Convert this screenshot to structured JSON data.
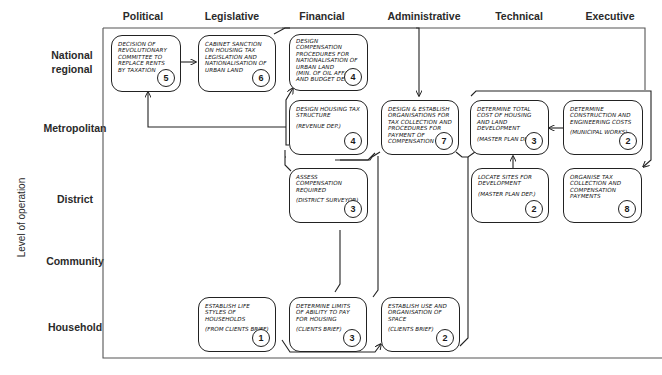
{
  "diagram": {
    "axis_label": "Level of operation",
    "columns": [
      "Political",
      "Legislative",
      "Financial",
      "Administrative",
      "Technical",
      "Executive"
    ],
    "rows": [
      "National regional",
      "Metropolitan",
      "District",
      "Community",
      "Household"
    ],
    "boxes": [
      {
        "id": "b1",
        "column": "Political",
        "row": "National regional",
        "text": "Decision of revolutionary committee to replace rents by taxation",
        "note": "",
        "number": "5"
      },
      {
        "id": "b2",
        "column": "Legislative",
        "row": "National regional",
        "text": "Cabinet sanction on housing tax legislation and nationalisation of urban land",
        "note": "",
        "number": "6"
      },
      {
        "id": "b3",
        "column": "Financial",
        "row": "National regional",
        "text": "Design compensation procedures for nationalisation of urban land",
        "note": "(Min. of Oil Affairs and Budget Dep.)",
        "number": "4"
      },
      {
        "id": "b4",
        "column": "Financial",
        "row": "Metropolitan",
        "text": "Design housing tax structure",
        "note": "(Revenue Dep.)",
        "number": "4"
      },
      {
        "id": "b5",
        "column": "Administrative",
        "row": "Metropolitan",
        "text": "Design & establish organisations for tax collection and procedures for payment of compensation",
        "note": "",
        "number": "7"
      },
      {
        "id": "b6",
        "column": "Technical",
        "row": "Metropolitan",
        "text": "Determine total cost of housing and land development",
        "note": "(Master Plan Dep.)",
        "number": "3"
      },
      {
        "id": "b7",
        "column": "Executive",
        "row": "Metropolitan",
        "text": "Determine construction and engineering costs",
        "note": "(Municipal Works)",
        "number": "2"
      },
      {
        "id": "b8",
        "column": "Financial",
        "row": "District",
        "text": "Assess compensation required",
        "note": "(District Surveyor)",
        "number": "3"
      },
      {
        "id": "b9",
        "column": "Technical",
        "row": "District",
        "text": "Locate sites for development",
        "note": "(Master Plan Dep.)",
        "number": "2"
      },
      {
        "id": "b10",
        "column": "Executive",
        "row": "District",
        "text": "Organise tax collection and compensation payments",
        "note": "",
        "number": "8"
      },
      {
        "id": "b11",
        "column": "Legislative",
        "row": "Household",
        "text": "Establish life styles of households",
        "note": "(From clients brief)",
        "number": "1"
      },
      {
        "id": "b12",
        "column": "Financial",
        "row": "Household",
        "text": "Determine limits of ability to pay for housing",
        "note": "(Clients brief)",
        "number": "3"
      },
      {
        "id": "b13",
        "column": "Administrative",
        "row": "Household",
        "text": "Establish use and organisation of space",
        "note": "(Clients brief)",
        "number": "2"
      }
    ],
    "connectors": [
      {
        "from": "Decision of revolutionary committee (5)",
        "to": "Cabinet sanction (6)"
      },
      {
        "from": "Cabinet sanction (6)",
        "to": "Design & establish organisations (7)"
      },
      {
        "from": "Design housing tax structure (4)",
        "to": "Decision of revolutionary committee (5)"
      },
      {
        "from": "Design housing tax structure (4)",
        "to": "Design compensation procedures (4)"
      },
      {
        "from": "Design & establish organisations (7)",
        "to": "Design housing tax structure (4)"
      },
      {
        "from": "Determine construction and engineering costs (2)",
        "to": "Determine total cost (3)"
      },
      {
        "from": "Locate sites for development (2)",
        "to": "Determine total cost (3)"
      },
      {
        "from": "Determine total cost (3)",
        "to": "Design & establish organisations (7)"
      },
      {
        "from": "Determine construction and engineering costs (2)",
        "to": "Organise tax collection (8)"
      },
      {
        "from": "Establish life styles of households (1)",
        "to": "Establish use and organisation of space (2)"
      },
      {
        "from": "Establish use and organisation of space (2)",
        "to": "Determine total cost (3)"
      },
      {
        "from": "Determine limits of ability to pay (3)",
        "to": "Design housing tax structure (4)"
      },
      {
        "from": "Assess compensation required (3)",
        "to": "Design compensation procedures (4)"
      }
    ]
  }
}
